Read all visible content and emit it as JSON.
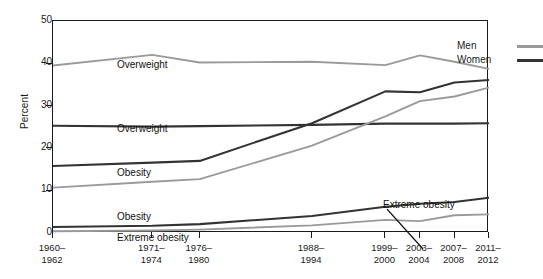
{
  "axes": {
    "ylabel": "Percent",
    "y_ticks": [
      "0",
      "10",
      "20",
      "30",
      "40",
      "50"
    ],
    "x_ticks": [
      {
        "line1": "1960–",
        "line2": "1962"
      },
      {
        "line1": "1971–",
        "line2": "1974"
      },
      {
        "line1": "1976–",
        "line2": "1980"
      },
      {
        "line1": "1988–",
        "line2": "1994"
      },
      {
        "line1": "1999–",
        "line2": "2000"
      },
      {
        "line1": "2003–",
        "line2": "2004"
      },
      {
        "line1": "2007–",
        "line2": "2008"
      },
      {
        "line1": "2011–",
        "line2": "2012"
      }
    ]
  },
  "legend": {
    "position": "top-right",
    "entries": [
      {
        "label": "Men",
        "color": "#9a9a9a"
      },
      {
        "label": "Women",
        "color": "#333333"
      }
    ]
  },
  "annotations": {
    "overweight_men": "Overweight",
    "overweight_women": "Overweight",
    "obesity_women": "Obesity",
    "obesity_men": "Obesity",
    "extreme_obesity_women": "Extreme obesity",
    "extreme_obesity_men": "Extreme obesity"
  },
  "chart_data": {
    "type": "line",
    "title": "",
    "xlabel": "",
    "ylabel": "Percent",
    "ylim": [
      0,
      50
    ],
    "grid": false,
    "legend_position": "top-right",
    "categories": [
      "1960–1962",
      "1971–1974",
      "1976–1980",
      "1988–1994",
      "1999–2000",
      "2003–2004",
      "2007–2008",
      "2011–2012"
    ],
    "x_positions_year": [
      1961,
      1972.5,
      1978,
      1991,
      1999.5,
      2003.5,
      2007.5,
      2011.5
    ],
    "xlim_year": [
      1961,
      2011.5
    ],
    "series": [
      {
        "name": "Overweight, Men",
        "color": "#9a9a9a",
        "values": [
          39.5,
          42.0,
          40.2,
          40.4,
          39.6,
          41.9,
          40.4,
          38.7
        ]
      },
      {
        "name": "Overweight, Women",
        "color": "#333333",
        "values": [
          25.3,
          25.1,
          25.2,
          25.5,
          25.8,
          25.8,
          25.8,
          25.9
        ]
      },
      {
        "name": "Obesity, Men",
        "color": "#9a9a9a",
        "values": [
          10.7,
          12.1,
          12.7,
          20.6,
          27.5,
          31.1,
          32.2,
          34.3
        ]
      },
      {
        "name": "Obesity, Women",
        "color": "#333333",
        "values": [
          15.8,
          16.6,
          17.0,
          25.9,
          33.4,
          33.2,
          35.5,
          36.1
        ]
      },
      {
        "name": "Extreme obesity, Men",
        "color": "#9a9a9a",
        "values": [
          0.4,
          0.6,
          0.8,
          1.8,
          3.1,
          2.8,
          4.2,
          4.4
        ]
      },
      {
        "name": "Extreme obesity, Women",
        "color": "#333333",
        "values": [
          1.4,
          1.7,
          2.1,
          4.0,
          6.2,
          6.9,
          7.3,
          8.3
        ]
      }
    ]
  }
}
